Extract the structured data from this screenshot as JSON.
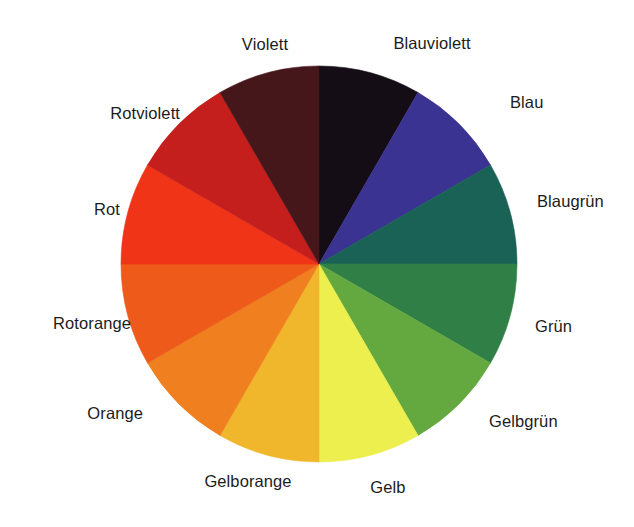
{
  "figure": {
    "name": "farbkreis",
    "background_color": "#ffffff",
    "center": {
      "x": 319,
      "y": 264
    },
    "radius": 198,
    "segment_count": 12,
    "label_text_color": "#1c1c1c"
  },
  "chart_data": {
    "type": "pie",
    "title": "",
    "subtitle": "",
    "xlabel": "",
    "ylabel": "",
    "legend_position": "around",
    "grid": false,
    "categories": [
      "Blauviolett",
      "Blau",
      "Blaugrün",
      "Grün",
      "Gelbgrün",
      "Gelb",
      "Gelborange",
      "Orange",
      "Rotorange",
      "Rot",
      "Rotviolett",
      "Violett"
    ],
    "values": [
      8.3333,
      8.3333,
      8.3333,
      8.3333,
      8.3333,
      8.3333,
      8.3333,
      8.3333,
      8.3333,
      8.3333,
      8.3333,
      8.3333
    ],
    "colors": [
      "#140d16",
      "#3b3391",
      "#1a6156",
      "#2f7f47",
      "#63a93f",
      "#ecef4e",
      "#f0b72c",
      "#ef7f1f",
      "#ed5a19",
      "#ef3418",
      "#c41f1c",
      "#45161a"
    ],
    "start_angle_deg": 0,
    "direction": "clockwise"
  },
  "segments": [
    {
      "name": "Blauviolett",
      "label": "Blauviolett",
      "color": "#140d16",
      "start": 0,
      "end": 30,
      "label_x": 432,
      "label_y": 43,
      "align": "center"
    },
    {
      "name": "Blau",
      "label": "Blau",
      "color": "#3b3391",
      "start": 30,
      "end": 60,
      "label_x": 510,
      "label_y": 102,
      "align": "right"
    },
    {
      "name": "Blaugrün",
      "label": "Blaugrün",
      "color": "#1a6156",
      "start": 60,
      "end": 90,
      "label_x": 537,
      "label_y": 201,
      "align": "right"
    },
    {
      "name": "Grün",
      "label": "Grün",
      "color": "#2f7f47",
      "start": 90,
      "end": 120,
      "label_x": 535,
      "label_y": 326,
      "align": "right"
    },
    {
      "name": "Gelbgrün",
      "label": "Gelbgrün",
      "color": "#63a93f",
      "start": 120,
      "end": 150,
      "label_x": 489,
      "label_y": 421,
      "align": "right"
    },
    {
      "name": "Gelb",
      "label": "Gelb",
      "color": "#ecef4e",
      "start": 150,
      "end": 180,
      "label_x": 388,
      "label_y": 487,
      "align": "center"
    },
    {
      "name": "Gelborange",
      "label": "Gelborange",
      "color": "#f0b72c",
      "start": 180,
      "end": 210,
      "label_x": 248,
      "label_y": 481,
      "align": "center"
    },
    {
      "name": "Orange",
      "label": "Orange",
      "color": "#ef7f1f",
      "start": 210,
      "end": 240,
      "label_x": 143,
      "label_y": 413,
      "align": "left"
    },
    {
      "name": "Rotorange",
      "label": "Rotorange",
      "color": "#ed5a19",
      "start": 240,
      "end": 270,
      "label_x": 131,
      "label_y": 323,
      "align": "left"
    },
    {
      "name": "Rot",
      "label": "Rot",
      "color": "#ef3418",
      "start": 270,
      "end": 300,
      "label_x": 120,
      "label_y": 209,
      "align": "left"
    },
    {
      "name": "Rotviolett",
      "label": "Rotviolett",
      "color": "#c41f1c",
      "start": 300,
      "end": 330,
      "label_x": 180,
      "label_y": 113,
      "align": "left"
    },
    {
      "name": "Violett",
      "label": "Violett",
      "color": "#45161a",
      "start": 330,
      "end": 360,
      "label_x": 265,
      "label_y": 44,
      "align": "center"
    }
  ]
}
